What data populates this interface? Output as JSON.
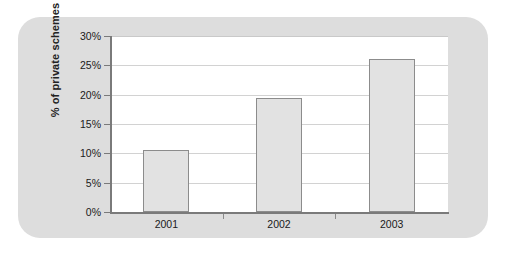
{
  "chart_data": {
    "type": "bar",
    "title": "",
    "xlabel": "",
    "ylabel": "% of private schemes",
    "categories": [
      "2001",
      "2002",
      "2003"
    ],
    "values": [
      10.5,
      19.5,
      26.0
    ],
    "ylim": [
      0,
      30
    ],
    "ytick_labels": [
      "0%",
      "5%",
      "10%",
      "15%",
      "20%",
      "25%",
      "30%"
    ],
    "ytick_values": [
      0,
      5,
      10,
      15,
      20,
      25,
      30
    ],
    "grid": true,
    "legend": null,
    "series": [
      {
        "name": "% of private schemes",
        "values": [
          10.5,
          19.5,
          26.0
        ]
      }
    ]
  },
  "style": {
    "panel_background": "#dddddd",
    "plot_background": "#ffffff",
    "bar_fill": "#e2e2e2",
    "bar_border": "#8c8c8c",
    "gridline_color": "#d2d2d2",
    "axis_color": "#7a7a7a",
    "text_color": "#1a1a1a"
  }
}
